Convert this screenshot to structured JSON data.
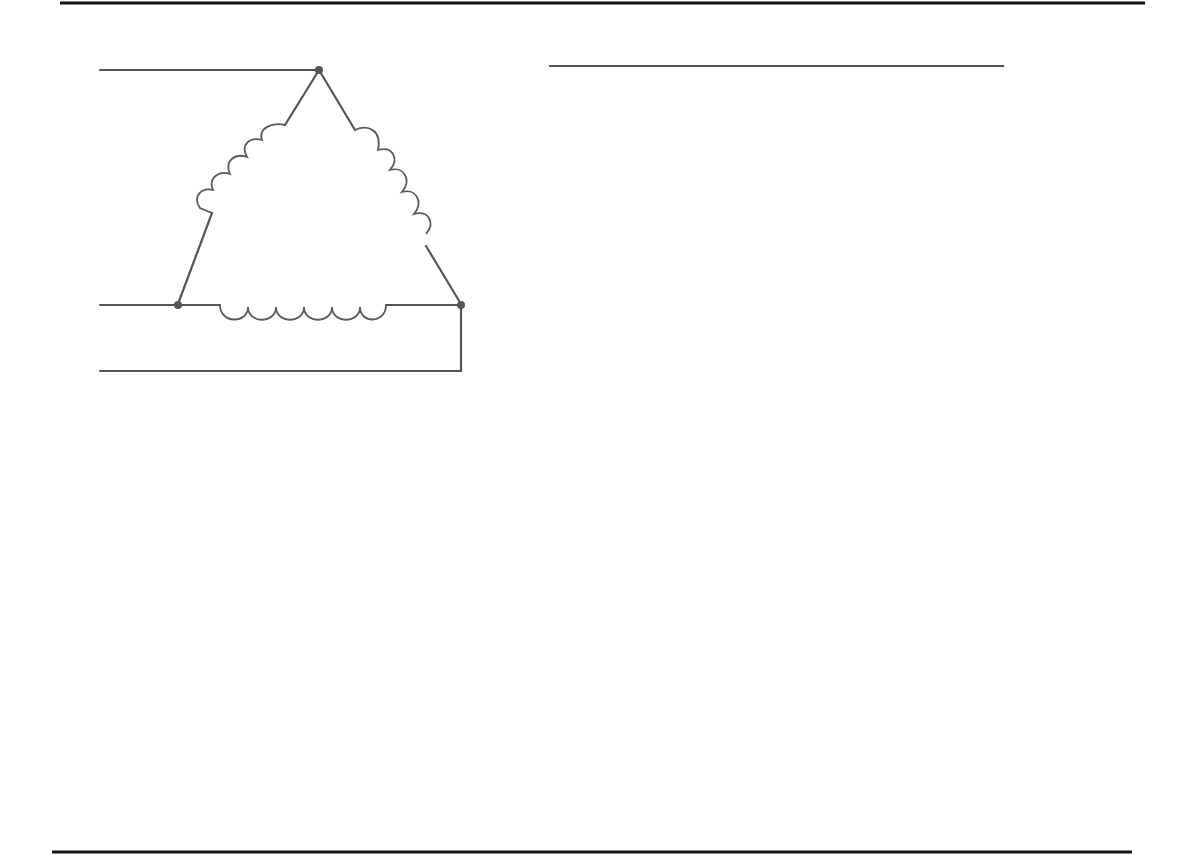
{
  "delta": {
    "title": "DELTA",
    "terminals": [
      "A",
      "B",
      "C"
    ]
  },
  "wye": {
    "title": "WYE OR STAR",
    "terminals": [
      "A",
      "C",
      "B"
    ]
  },
  "slip_ring": {
    "dc_source_line1": "DC",
    "dc_source_line2": "SOURCE",
    "brushes": "BRUSHES",
    "slip_rings_line1": "SLIP",
    "slip_rings_line2": "RINGS",
    "dc_field_line1": "DC",
    "dc_field_line2": "FIELD"
  },
  "colors": {
    "line": "#555555",
    "border": "#111111",
    "text": "#222222",
    "background": "#ffffff"
  }
}
